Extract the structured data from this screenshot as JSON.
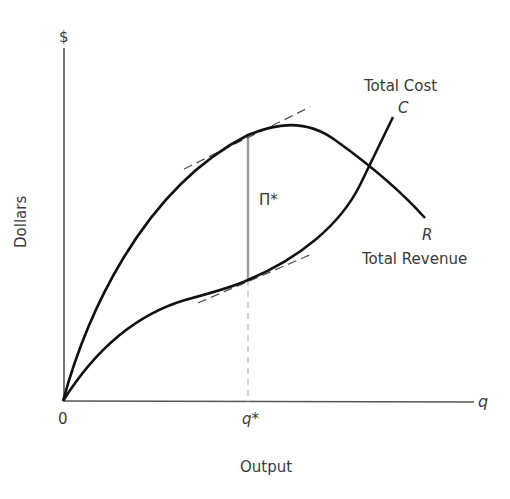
{
  "diagram": {
    "y_axis_symbol": "$",
    "y_axis_title": "Dollars",
    "x_axis_symbol": "q",
    "x_axis_title": "Output",
    "origin_label": "0",
    "q_star_label": "q*",
    "profit_label": "Π*",
    "cost_curve": {
      "title": "Total Cost",
      "symbol": "C"
    },
    "revenue_curve": {
      "title": "Total Revenue",
      "symbol": "R"
    },
    "colors": {
      "curves": "#111111",
      "axes": "#555555",
      "profit_line": "#9a9a9a",
      "tangents": "#555555",
      "guide": "#aaaaaa",
      "text": "#3a3a3a"
    }
  }
}
